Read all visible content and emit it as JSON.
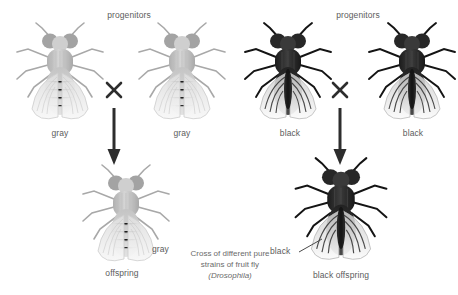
{
  "diagram": {
    "caption": {
      "line1": "Cross of different pure",
      "line2": "strains of fruit fly",
      "species": "(Drosophila)"
    },
    "crosses": [
      {
        "id": "gray-cross",
        "heading": "progenitors",
        "parent_left_label": "gray",
        "parent_right_label": "gray",
        "cross_symbol": "×",
        "offspring_phenotype_label": "gray",
        "offspring_label": "offspring",
        "phenotype_color": "#b9b9b9"
      },
      {
        "id": "black-cross",
        "heading": "progenitors",
        "parent_left_label": "black",
        "parent_right_label": "black",
        "cross_symbol": "×",
        "offspring_phenotype_label": "black",
        "offspring_label": "black offspring",
        "phenotype_color": "#2b2b2b"
      }
    ]
  }
}
